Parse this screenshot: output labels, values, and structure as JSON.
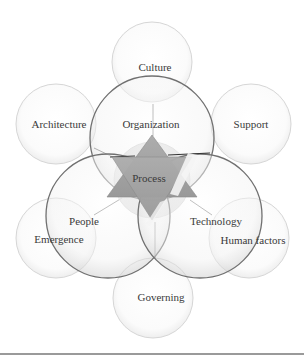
{
  "diagram": {
    "center": {
      "label": "Process",
      "shape": "six-pointed-star",
      "color": "#a3a3a3"
    },
    "core_circles": [
      {
        "label": "Organization"
      },
      {
        "label": "People"
      },
      {
        "label": "Technology"
      }
    ],
    "outer_circles": [
      {
        "label": "Culture"
      },
      {
        "label": "Architecture"
      },
      {
        "label": "Support"
      },
      {
        "label": "Emergence"
      },
      {
        "label": "Human factors"
      },
      {
        "label": "Governing"
      }
    ],
    "colors": {
      "core_circle_stroke": "#6f6f6f",
      "outer_circle_stroke": "#d4d4d4",
      "text": "#3a3a3a",
      "rule": "#9a9a9a"
    }
  }
}
